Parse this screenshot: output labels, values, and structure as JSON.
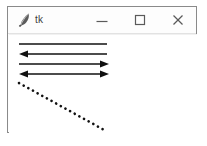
{
  "window": {
    "title": "tk",
    "icon": "feather-quill-icon",
    "frame_color": "#8a8a8a",
    "background": "#ffffff",
    "controls": [
      {
        "name": "minimize",
        "glyph": "minimize-icon",
        "label": "—"
      },
      {
        "name": "maximize",
        "glyph": "maximize-icon",
        "label": "□"
      },
      {
        "name": "close",
        "glyph": "close-icon",
        "label": "✕"
      }
    ]
  },
  "canvas": {
    "stroke_color": "#111111",
    "items": [
      {
        "id": "line-arrow-none",
        "type": "line",
        "arrow": "none",
        "dash": "solid",
        "x1": 10,
        "y1": 9,
        "x2": 98,
        "y2": 9
      },
      {
        "id": "line-arrow-first",
        "type": "line",
        "arrow": "first",
        "dash": "solid",
        "x1": 10,
        "y1": 19,
        "x2": 98,
        "y2": 19
      },
      {
        "id": "line-arrow-last",
        "type": "line",
        "arrow": "last",
        "dash": "solid",
        "x1": 10,
        "y1": 29,
        "x2": 100,
        "y2": 29
      },
      {
        "id": "line-arrow-both",
        "type": "line",
        "arrow": "both",
        "dash": "solid",
        "x1": 10,
        "y1": 39,
        "x2": 100,
        "y2": 39
      },
      {
        "id": "line-dotted-diagonal",
        "type": "line",
        "arrow": "none",
        "dash": "dotted",
        "x1": 10,
        "y1": 48,
        "x2": 97,
        "y2": 96
      }
    ]
  }
}
